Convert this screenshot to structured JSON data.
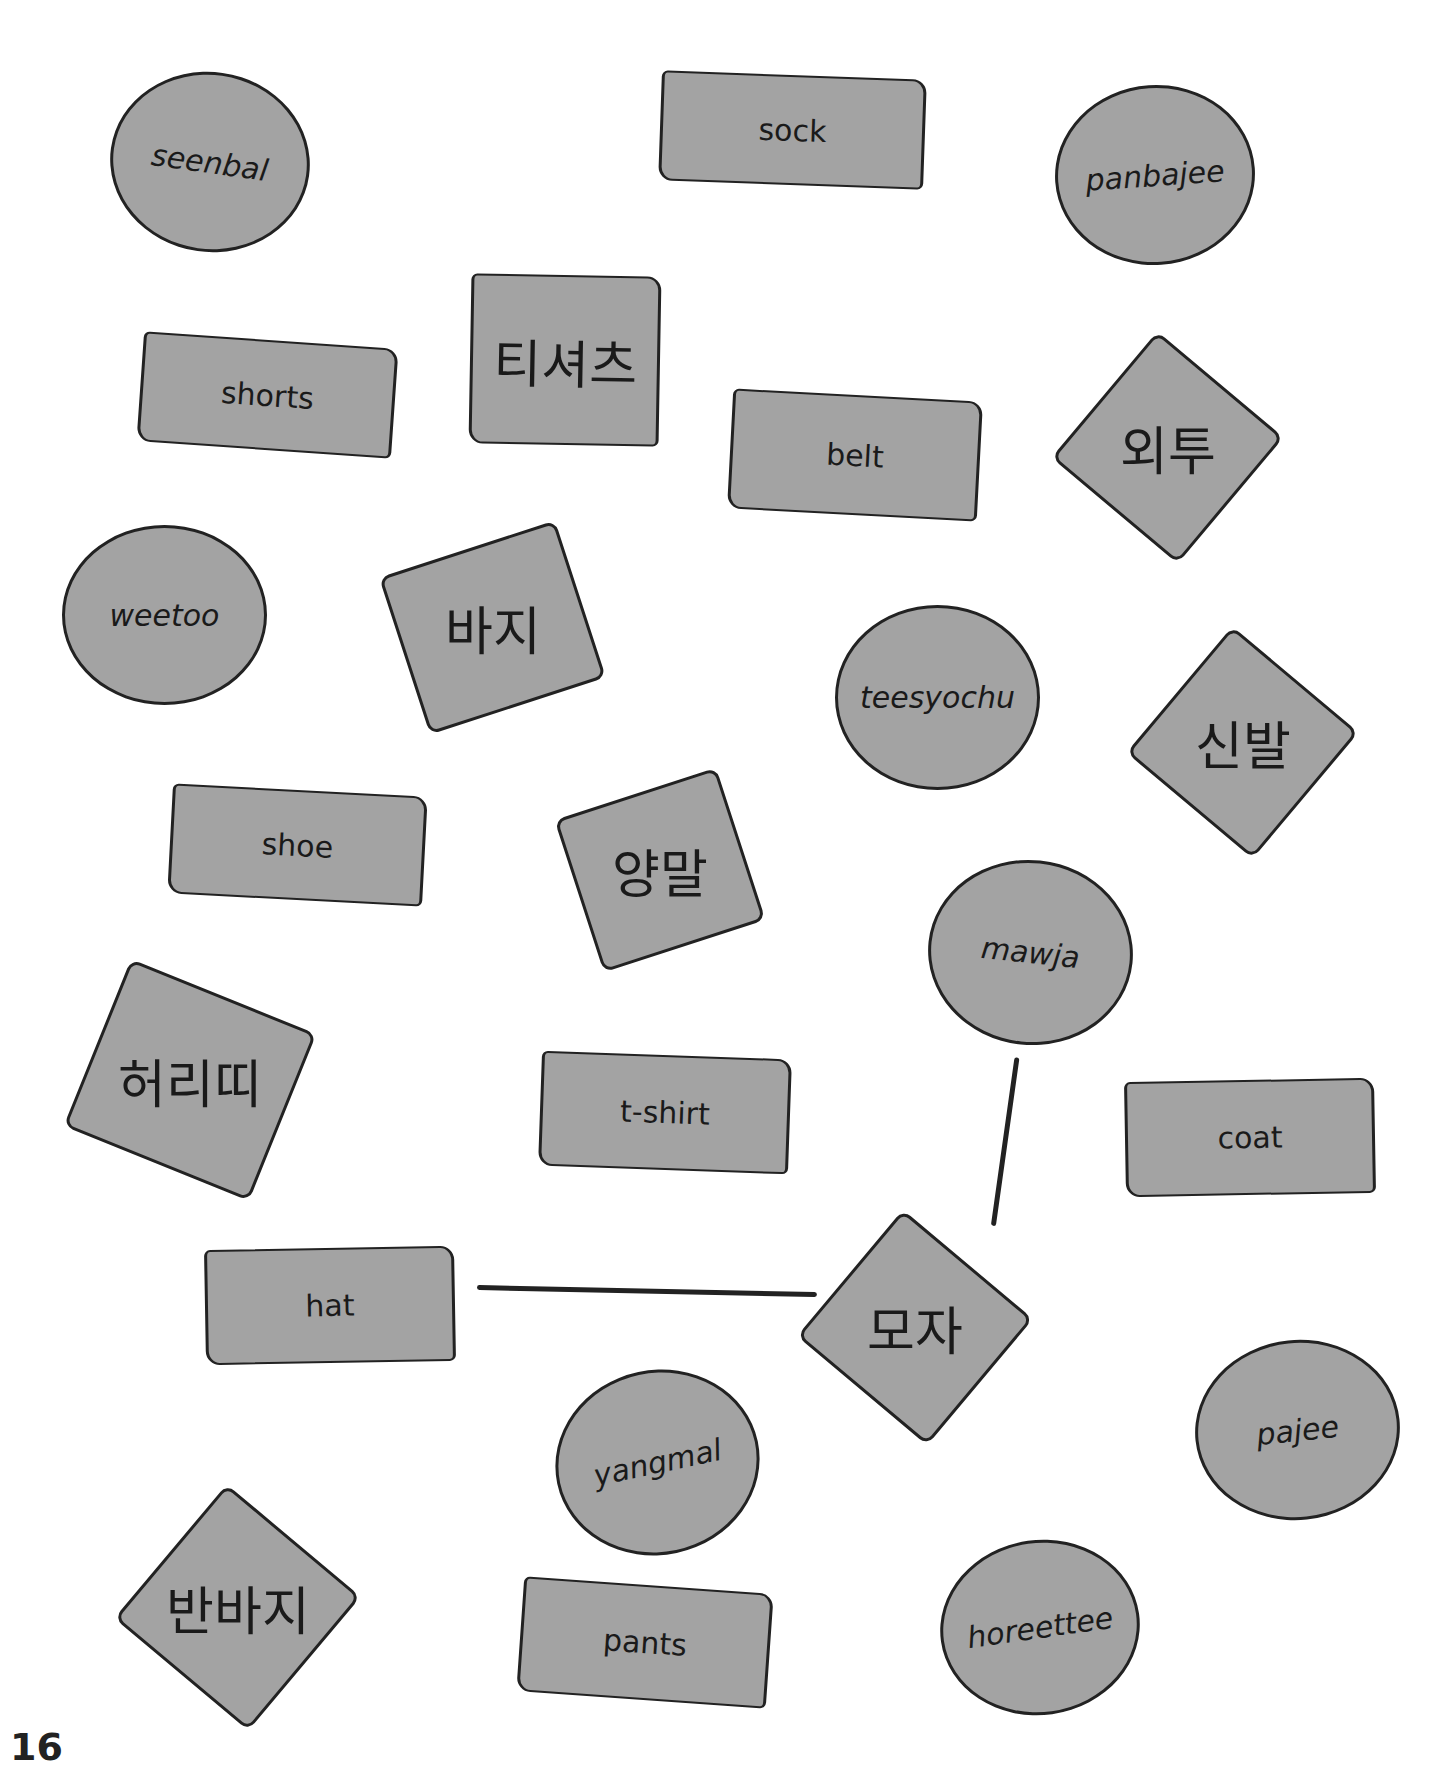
{
  "page_number": "16",
  "shapes": [
    {
      "id": "seenbal",
      "type": "circle",
      "text": "seenbal",
      "kind": "romanized",
      "x": 110,
      "y": 72,
      "w": 200,
      "h": 180,
      "rot": 8
    },
    {
      "id": "sock",
      "type": "rect",
      "text": "sock",
      "kind": "english",
      "x": 660,
      "y": 75,
      "w": 265,
      "h": 110,
      "rot": 2
    },
    {
      "id": "panbajee",
      "type": "circle",
      "text": "panbajee",
      "kind": "romanized",
      "x": 1055,
      "y": 85,
      "w": 200,
      "h": 180,
      "rot": -4
    },
    {
      "id": "shorts",
      "type": "rect",
      "text": "shorts",
      "kind": "english",
      "x": 140,
      "y": 340,
      "w": 255,
      "h": 110,
      "rot": 4
    },
    {
      "id": "tisyeocheu",
      "type": "rect",
      "text": "티셔츠",
      "kind": "korean",
      "x": 470,
      "y": 275,
      "w": 190,
      "h": 170,
      "rot": 1
    },
    {
      "id": "belt",
      "type": "rect",
      "text": "belt",
      "kind": "english",
      "x": 730,
      "y": 395,
      "w": 250,
      "h": 120,
      "rot": 3
    },
    {
      "id": "oetu",
      "type": "diamond",
      "text": "외투",
      "kind": "korean",
      "x": 1085,
      "y": 365,
      "w": 165,
      "h": 165,
      "rot": 40
    },
    {
      "id": "weetoo",
      "type": "circle",
      "text": "weetoo",
      "kind": "romanized",
      "x": 62,
      "y": 525,
      "w": 205,
      "h": 180,
      "rot": 0
    },
    {
      "id": "baji",
      "type": "diamond",
      "text": "바지",
      "kind": "korean",
      "x": 400,
      "y": 545,
      "w": 185,
      "h": 165,
      "rot": -18
    },
    {
      "id": "teesyochu",
      "type": "circle",
      "text": "teesyochu",
      "kind": "romanized",
      "x": 835,
      "y": 605,
      "w": 205,
      "h": 185,
      "rot": 0
    },
    {
      "id": "sinbal",
      "type": "diamond",
      "text": "신발",
      "kind": "korean",
      "x": 1160,
      "y": 660,
      "w": 165,
      "h": 165,
      "rot": 40
    },
    {
      "id": "shoe",
      "type": "rect",
      "text": "shoe",
      "kind": "english",
      "x": 170,
      "y": 790,
      "w": 255,
      "h": 110,
      "rot": 3
    },
    {
      "id": "yangmal",
      "type": "diamond",
      "text": "양말",
      "kind": "korean",
      "x": 575,
      "y": 790,
      "w": 170,
      "h": 160,
      "rot": -18
    },
    {
      "id": "mawja",
      "type": "circle",
      "text": "mawja",
      "kind": "romanized",
      "x": 928,
      "y": 860,
      "w": 205,
      "h": 185,
      "rot": 6
    },
    {
      "id": "heoritti",
      "type": "diamond",
      "text": "허리띠",
      "kind": "korean",
      "x": 90,
      "y": 990,
      "w": 200,
      "h": 180,
      "rot": 22
    },
    {
      "id": "tshirt",
      "type": "rect",
      "text": "t-shirt",
      "kind": "english",
      "x": 540,
      "y": 1055,
      "w": 250,
      "h": 115,
      "rot": 2
    },
    {
      "id": "coat",
      "type": "rect",
      "text": "coat",
      "kind": "english",
      "x": 1125,
      "y": 1080,
      "w": 250,
      "h": 115,
      "rot": -1
    },
    {
      "id": "hat",
      "type": "rect",
      "text": "hat",
      "kind": "english",
      "x": 205,
      "y": 1248,
      "w": 250,
      "h": 115,
      "rot": -1
    },
    {
      "id": "moja",
      "type": "diamond",
      "text": "모자",
      "kind": "korean",
      "x": 830,
      "y": 1245,
      "w": 170,
      "h": 165,
      "rot": 40
    },
    {
      "id": "yangmal_rom",
      "type": "circle",
      "text": "yangmal",
      "kind": "romanized",
      "x": 555,
      "y": 1370,
      "w": 205,
      "h": 185,
      "rot": -12
    },
    {
      "id": "pajee",
      "type": "circle",
      "text": "pajee",
      "kind": "romanized",
      "x": 1195,
      "y": 1340,
      "w": 205,
      "h": 180,
      "rot": -6
    },
    {
      "id": "banbaji",
      "type": "diamond",
      "text": "반바지",
      "kind": "korean",
      "x": 150,
      "y": 1520,
      "w": 175,
      "h": 175,
      "rot": 40
    },
    {
      "id": "pants",
      "type": "rect",
      "text": "pants",
      "kind": "english",
      "x": 520,
      "y": 1585,
      "w": 250,
      "h": 115,
      "rot": 4
    },
    {
      "id": "horeettee",
      "type": "circle",
      "text": "horeettee",
      "kind": "romanized",
      "x": 940,
      "y": 1540,
      "w": 200,
      "h": 175,
      "rot": -8
    }
  ],
  "connector_lines": [
    {
      "from": "hat",
      "to": "moja",
      "x": 477,
      "y": 1285,
      "length": 340,
      "angle": 1.2
    },
    {
      "from": "mawja",
      "to": "moja",
      "x": 1017,
      "y": 1055,
      "length": 170,
      "angle": 98
    }
  ]
}
